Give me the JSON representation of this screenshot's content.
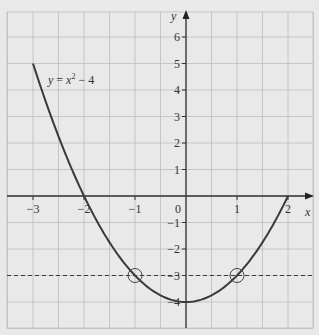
{
  "chart_data": {
    "type": "line",
    "title": "",
    "xlabel": "x",
    "ylabel": "y",
    "xlim": [
      -3.5,
      2.5
    ],
    "ylim": [
      -5,
      7
    ],
    "grid": true,
    "x_ticks": [
      -3,
      -2,
      -1,
      0,
      1,
      2
    ],
    "x_tick_labels": [
      "−3",
      "−2",
      "−1",
      "0",
      "1",
      "2"
    ],
    "y_ticks": [
      6,
      5,
      4,
      3,
      2,
      1,
      -1,
      -2,
      -3,
      -4
    ],
    "y_tick_labels": [
      "6",
      "5",
      "4",
      "3",
      "2",
      "1",
      "−1",
      "−2",
      "−3",
      "−4"
    ],
    "series": [
      {
        "name": "y = x² − 4",
        "function": "x^2 - 4",
        "domain": [
          -3,
          2
        ],
        "style": "solid",
        "color": "#3a3a3a",
        "x": [
          -3,
          -2.5,
          -2,
          -1.5,
          -1,
          -0.5,
          0,
          0.5,
          1,
          1.5,
          2
        ],
        "values": [
          5,
          2.25,
          0,
          -1.75,
          -3,
          -3.75,
          -4,
          -3.75,
          -3,
          -1.75,
          0
        ]
      },
      {
        "name": "y = -3",
        "function": "-3",
        "style": "dashed",
        "color": "#3a3a3a",
        "x": [
          -3.5,
          2.5
        ],
        "values": [
          -3,
          -3
        ]
      }
    ],
    "annotations": [
      {
        "type": "label",
        "text_y": "y",
        "text_eq": "=",
        "text_x": "x",
        "text_sup": "2",
        "text_rest": " − 4",
        "at": [
          -2.45,
          4.2
        ]
      },
      {
        "type": "circle",
        "at": [
          -1,
          -3
        ]
      },
      {
        "type": "circle",
        "at": [
          1,
          -3
        ]
      }
    ]
  },
  "labels": {
    "x_axis": "x",
    "y_axis": "y",
    "origin": "0",
    "equation": {
      "y": "y",
      "eq": " = ",
      "x": "x",
      "sup": "2",
      "rest": " − 4"
    }
  }
}
